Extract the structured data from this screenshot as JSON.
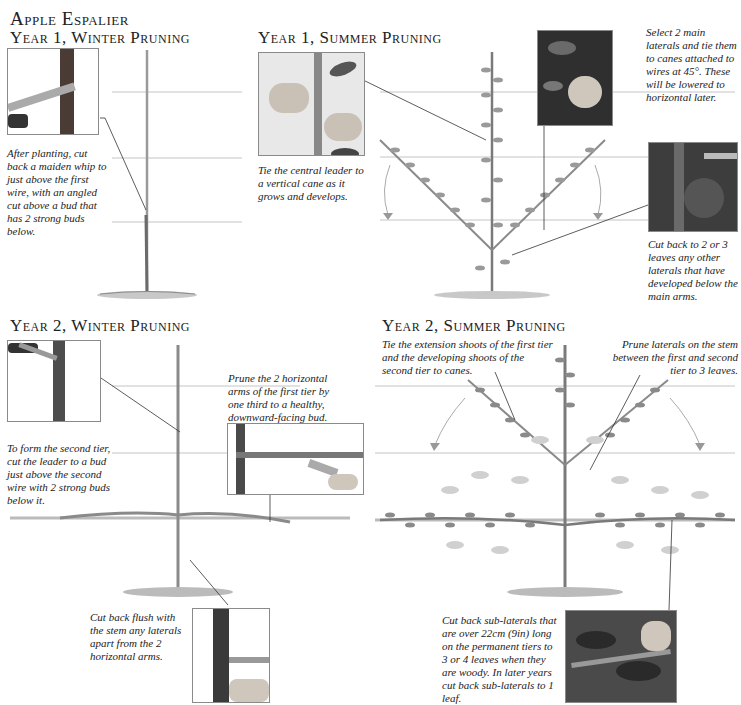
{
  "page": {
    "title": "Apple Espalier"
  },
  "sections": [
    {
      "heading": "Year 1, Winter Pruning",
      "captions": [
        "After planting, cut back a maiden whip to just above the first wire, with an angled cut above a bud that has 2 strong buds below."
      ]
    },
    {
      "heading": "Year 1, Summer Pruning",
      "captions": [
        "Tie the central leader to a vertical cane as it grows and develops.",
        "Select 2 main laterals and tie them to canes attached to wires at 45°. These will be lowered to horizontal later.",
        "Cut back to 2 or 3 leaves any other laterals that have developed below the main arms."
      ]
    },
    {
      "heading": "Year 2, Winter Pruning",
      "captions": [
        "To form the second tier, cut the leader to a bud just above the second wire with 2 strong buds below it.",
        "Prune the 2 horizontal arms of the first tier by one third to a healthy, downward-facing bud.",
        "Cut back flush with the stem any laterals apart from the 2 horizontal arms."
      ]
    },
    {
      "heading": "Year 2, Summer Pruning",
      "captions": [
        "Tie the extension shoots of the first tier and the developing shoots of the second tier to canes.",
        "Prune laterals on the stem between the first and second tier to 3 leaves.",
        "Cut back sub-laterals that are over 22cm (9in) long on the permanent tiers to 3 or 4 leaves when they are woody. In later years cut back sub-laterals to 1 leaf."
      ]
    }
  ],
  "colors": {
    "wire": "#b8b8b8",
    "stem": "#6b6b6b",
    "leaf": "#8a8a8a",
    "leaf_faded": "#c8c8c8",
    "photo_dark": "#3a3a3a",
    "ground": "#9a9a9a"
  }
}
